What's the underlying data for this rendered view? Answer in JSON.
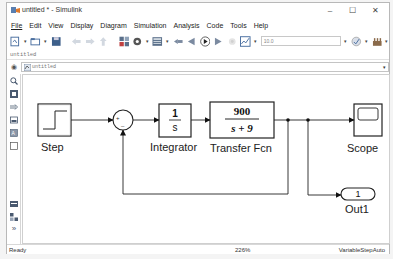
{
  "window": {
    "title": "untitled * - Simulink",
    "controls": {
      "minimize": "–",
      "maximize": "☐",
      "close": "✕"
    }
  },
  "menu": [
    "File",
    "Edit",
    "View",
    "Display",
    "Diagram",
    "Simulation",
    "Analysis",
    "Code",
    "Tools",
    "Help"
  ],
  "toolbar": {
    "icons": [
      "new-model-icon",
      "open-icon",
      "save-icon",
      "back-icon",
      "forward-icon",
      "up-icon",
      "library-browser-icon",
      "model-config-icon",
      "model-explorer-icon",
      "step-back-icon",
      "run-icon",
      "step-forward-icon",
      "stop-icon",
      "record-icon",
      "data-inspector-icon",
      "build-icon"
    ],
    "stop_time": "10.0"
  },
  "tab": {
    "label": "untitled"
  },
  "address": {
    "path": "untitled"
  },
  "palette": {
    "icons": [
      "zoom-icon",
      "fit-view-icon",
      "arrow-icon",
      "image-icon",
      "annotation-icon",
      "area-icon",
      "explorer-bar-icon",
      "model-browser-icon",
      "expand-icon"
    ]
  },
  "diagram": {
    "blocks": [
      {
        "name": "Step",
        "label": "Step"
      },
      {
        "name": "Sum",
        "label": "",
        "signs": [
          "+",
          "–"
        ]
      },
      {
        "name": "Integrator",
        "label": "Integrator",
        "numerator": "1",
        "denominator": "s"
      },
      {
        "name": "Transfer Fcn",
        "label": "Transfer Fcn",
        "numerator": "900",
        "denominator": "s + 9"
      },
      {
        "name": "Scope",
        "label": "Scope"
      },
      {
        "name": "Out1",
        "label": "Out1",
        "port": "1"
      }
    ]
  },
  "status": {
    "left": "Ready",
    "zoom": "226%",
    "solver": "VariableStepAuto"
  }
}
